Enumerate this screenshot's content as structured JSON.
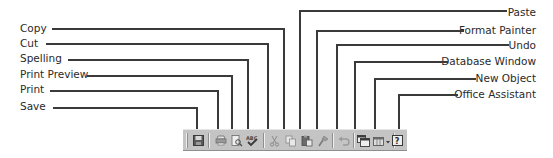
{
  "callouts": {
    "left": [
      {
        "id": "copy",
        "label": "Copy"
      },
      {
        "id": "cut",
        "label": "Cut"
      },
      {
        "id": "spelling",
        "label": "Spelling"
      },
      {
        "id": "print_preview",
        "label": "Print Preview"
      },
      {
        "id": "print",
        "label": "Print"
      },
      {
        "id": "save",
        "label": "Save"
      }
    ],
    "right": [
      {
        "id": "paste",
        "label": "Paste"
      },
      {
        "id": "format_painter",
        "label": "Format Painter"
      },
      {
        "id": "undo",
        "label": "Undo"
      },
      {
        "id": "database_window",
        "label": "Database Window"
      },
      {
        "id": "new_object",
        "label": "New Object"
      },
      {
        "id": "office_assistant",
        "label": "Office Assistant"
      }
    ]
  },
  "toolbar": {
    "buttons": [
      {
        "id": "save",
        "icon": "floppy-disk-icon"
      },
      {
        "id": "print",
        "icon": "printer-icon"
      },
      {
        "id": "print_preview",
        "icon": "print-preview-icon"
      },
      {
        "id": "spelling",
        "icon": "spelling-check-icon"
      },
      {
        "id": "cut",
        "icon": "scissors-icon"
      },
      {
        "id": "copy",
        "icon": "copy-icon"
      },
      {
        "id": "paste",
        "icon": "clipboard-paste-icon"
      },
      {
        "id": "format_painter",
        "icon": "paintbrush-icon"
      },
      {
        "id": "undo",
        "icon": "undo-arrow-icon"
      },
      {
        "id": "database_window",
        "icon": "database-window-icon"
      },
      {
        "id": "new_object",
        "icon": "new-object-icon"
      },
      {
        "id": "office_assistant",
        "icon": "help-assistant-icon"
      }
    ],
    "background_color": "#c4c4c4"
  }
}
